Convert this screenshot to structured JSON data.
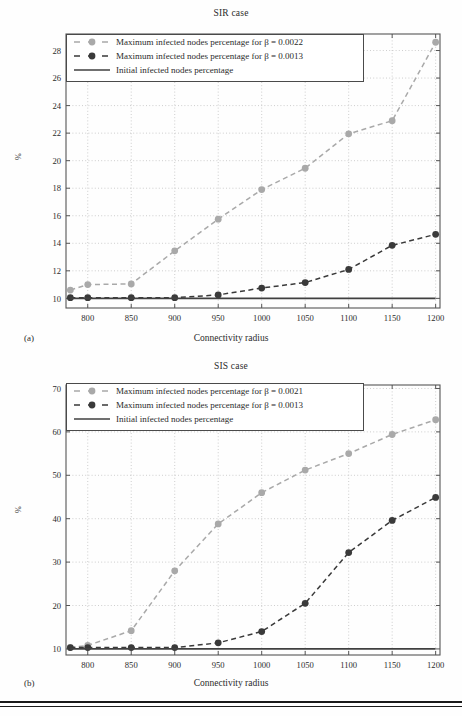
{
  "figure": {
    "panel_a_label": "(a)",
    "panel_b_label": "(b)",
    "colors": {
      "series_light": "#a9a9a9",
      "series_dark": "#3a3a3a",
      "baseline": "#404040",
      "axis": "#555555",
      "grid": "#b9b9b9",
      "background": "#ffffff"
    }
  },
  "chart_data": [
    {
      "type": "line",
      "title": "SIR case",
      "xlabel": "Connectivity radius",
      "ylabel": "%",
      "xlim": [
        775,
        1205
      ],
      "ylim": [
        9.3,
        29.2
      ],
      "xticks": [
        800,
        850,
        900,
        950,
        1000,
        1050,
        1100,
        1150,
        1200
      ],
      "yticks": [
        10,
        12,
        14,
        16,
        18,
        20,
        22,
        24,
        26,
        28
      ],
      "grid": true,
      "legend_position": "upper left",
      "x": [
        780,
        800,
        850,
        900,
        950,
        1000,
        1050,
        1100,
        1150,
        1200
      ],
      "series": [
        {
          "name": "Maximum infected nodes percentage for β = 0.0022",
          "color": "#a9a9a9",
          "style": "dashed-marker",
          "values": [
            10.6,
            11.0,
            11.05,
            13.45,
            15.75,
            17.9,
            19.45,
            21.95,
            22.9,
            28.6
          ]
        },
        {
          "name": "Maximum infected nodes percentage for β = 0.0013",
          "color": "#3a3a3a",
          "style": "dashed-marker",
          "values": [
            10.05,
            10.05,
            10.05,
            10.05,
            10.25,
            10.75,
            11.15,
            12.1,
            13.85,
            14.65
          ]
        },
        {
          "name": "Initial infected nodes percentage",
          "color": "#404040",
          "style": "solid",
          "values": [
            10,
            10,
            10,
            10,
            10,
            10,
            10,
            10,
            10,
            10
          ]
        }
      ]
    },
    {
      "type": "line",
      "title": "SIS case",
      "xlabel": "Connectivity radius",
      "ylabel": "%",
      "xlim": [
        775,
        1205
      ],
      "ylim": [
        8.6,
        70.8
      ],
      "xticks": [
        800,
        850,
        900,
        950,
        1000,
        1050,
        1100,
        1150,
        1200
      ],
      "yticks": [
        10,
        20,
        30,
        40,
        50,
        60,
        70
      ],
      "grid": true,
      "legend_position": "upper left",
      "x": [
        780,
        800,
        850,
        900,
        950,
        1000,
        1050,
        1100,
        1150,
        1200
      ],
      "series": [
        {
          "name": "Maximum infected nodes percentage for β = 0.0021",
          "color": "#a9a9a9",
          "style": "dashed-marker",
          "values": [
            10.3,
            10.8,
            14.2,
            28.0,
            38.8,
            46.0,
            51.2,
            55.0,
            59.4,
            62.8
          ]
        },
        {
          "name": "Maximum infected nodes percentage for β = 0.0013",
          "color": "#3a3a3a",
          "style": "dashed-marker",
          "values": [
            10.3,
            10.3,
            10.3,
            10.3,
            11.4,
            14.0,
            20.5,
            32.2,
            39.6,
            44.9
          ]
        },
        {
          "name": "Initial infected nodes percentage",
          "color": "#404040",
          "style": "solid",
          "values": [
            10,
            10,
            10,
            10,
            10,
            10,
            10,
            10,
            10,
            10
          ]
        }
      ]
    }
  ]
}
